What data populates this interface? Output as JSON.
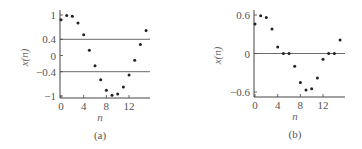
{
  "chart_data": [
    {
      "type": "scatter",
      "caption": "(a)",
      "xlabel": "n",
      "ylabel": "x(n)",
      "xticks": [
        0,
        4,
        8,
        12
      ],
      "yticks": [
        1,
        0.4,
        0,
        -0.4,
        -1
      ],
      "ytick_labels": [
        "1",
        "0.4",
        "0",
        "−0.4",
        "−1"
      ],
      "ylim": [
        -1,
        1
      ],
      "xlim": [
        0,
        15
      ],
      "reference_lines": [
        0.4,
        -0.4
      ],
      "x": [
        0,
        1,
        2,
        3,
        4,
        5,
        6,
        7,
        8,
        9,
        10,
        11,
        12,
        13,
        14,
        15
      ],
      "values": [
        0.88,
        0.99,
        0.97,
        0.8,
        0.51,
        0.13,
        -0.25,
        -0.6,
        -0.86,
        -0.98,
        -0.95,
        -0.78,
        -0.48,
        -0.12,
        0.27,
        0.62
      ]
    },
    {
      "type": "scatter",
      "caption": "(b)",
      "xlabel": "n",
      "ylabel": "x(n)",
      "xticks": [
        0,
        4,
        8,
        12
      ],
      "yticks": [
        0.6,
        0,
        -0.6
      ],
      "ytick_labels": [
        "0.6",
        "0",
        "−0.6"
      ],
      "ylim": [
        -0.6,
        0.6
      ],
      "xlim": [
        0,
        15
      ],
      "reference_lines": [
        0
      ],
      "x": [
        0,
        1,
        2,
        3,
        4,
        5,
        6,
        7,
        8,
        9,
        10,
        11,
        12,
        13,
        14,
        15
      ],
      "values": [
        0.46,
        0.59,
        0.56,
        0.38,
        0.1,
        0.0,
        0.0,
        -0.2,
        -0.45,
        -0.57,
        -0.55,
        -0.38,
        -0.09,
        0.0,
        0.0,
        0.21
      ]
    }
  ],
  "colors": {
    "axis": "#444444",
    "point": "#222222",
    "text": "#555555"
  }
}
